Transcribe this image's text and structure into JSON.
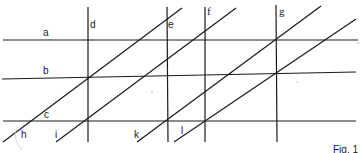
{
  "figure": {
    "caption": "Fig. 1",
    "line_color": "#1a1a1a",
    "background": "#ffffff"
  },
  "labels": {
    "a": "a",
    "b": "b",
    "c": "c",
    "d": "d",
    "e": "e",
    "f": "f",
    "g": "g",
    "h": "h",
    "i": "i",
    "k": "k",
    "l": "l"
  },
  "lines": {
    "horizontal": [
      {
        "label": "a",
        "x1": 3,
        "y1": 40,
        "x2": 358,
        "y2": 40
      },
      {
        "label": "b",
        "x1": 2,
        "y1": 79,
        "x2": 356,
        "y2": 72
      },
      {
        "label": "c",
        "x1": 3,
        "y1": 121,
        "x2": 356,
        "y2": 121
      }
    ],
    "vertical": [
      {
        "label": "d",
        "x1": 88,
        "y1": 7,
        "x2": 88,
        "y2": 142
      },
      {
        "label": "e",
        "x1": 167,
        "y1": 7,
        "x2": 168,
        "y2": 142
      },
      {
        "label": "f",
        "x1": 205,
        "y1": 7,
        "x2": 205,
        "y2": 142
      },
      {
        "label": "g",
        "x1": 276,
        "y1": 5,
        "x2": 277,
        "y2": 142
      }
    ],
    "diagonal": [
      {
        "label": "h",
        "x1": 3,
        "y1": 142,
        "x2": 182,
        "y2": 8
      },
      {
        "label": "i",
        "x1": 56,
        "y1": 142,
        "x2": 236,
        "y2": 8
      },
      {
        "label": "k",
        "x1": 137,
        "y1": 142,
        "x2": 321,
        "y2": 6
      },
      {
        "label": "l",
        "x1": 174,
        "y1": 142,
        "x2": 356,
        "y2": 19
      }
    ]
  }
}
